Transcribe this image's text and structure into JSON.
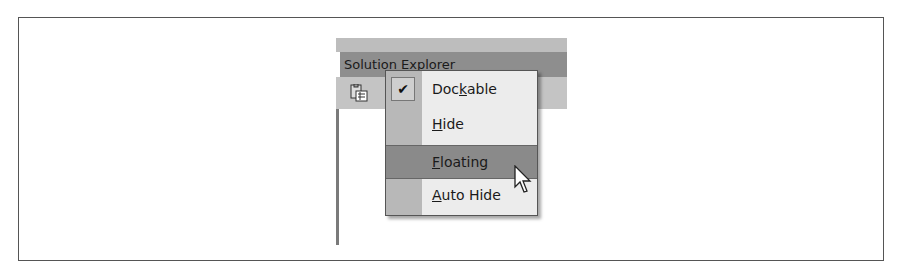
{
  "panel": {
    "title": "Solution Explorer",
    "toolbar_icon": "properties-icon"
  },
  "menu": {
    "items": [
      {
        "label_pre": "Doc",
        "mnemonic": "k",
        "label_post": "able",
        "checked": true,
        "highlighted": false
      },
      {
        "label_pre": "",
        "mnemonic": "H",
        "label_post": "ide",
        "checked": false,
        "highlighted": false
      },
      {
        "label_pre": "",
        "mnemonic": "F",
        "label_post": "loating",
        "checked": false,
        "highlighted": true
      },
      {
        "label_pre": "",
        "mnemonic": "A",
        "label_post": "uto Hide",
        "checked": false,
        "highlighted": false
      }
    ],
    "check_glyph": "✔"
  },
  "colors": {
    "titlebar": "#8e8e8e",
    "highlight": "#8a8a8a",
    "menu_bg": "#ececec",
    "gutter": "#b8b8b8"
  }
}
